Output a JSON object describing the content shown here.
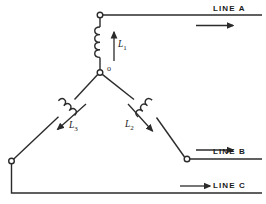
{
  "diagram": {
    "stroke_color": "#2b2b2b",
    "background_color": "#ffffff",
    "lines": [
      {
        "id": "line-a",
        "label": "LINE A"
      },
      {
        "id": "line-b",
        "label": "LINE B"
      },
      {
        "id": "line-c",
        "label": "LINE C"
      }
    ],
    "coils": [
      {
        "id": "coil-1",
        "label": "L",
        "subscript": "1",
        "orientation": "vertical",
        "current_direction": "up"
      },
      {
        "id": "coil-2",
        "label": "L",
        "subscript": "2",
        "orientation": "diagonal-down-right",
        "current_direction": "down-right"
      },
      {
        "id": "coil-3",
        "label": "L",
        "subscript": "3",
        "orientation": "diagonal-down-left",
        "current_direction": "down-left"
      }
    ],
    "nodes": [
      {
        "id": "node-top",
        "label": ""
      },
      {
        "id": "node-center",
        "label": "o"
      },
      {
        "id": "node-left",
        "label": ""
      },
      {
        "id": "node-right",
        "label": ""
      }
    ]
  }
}
